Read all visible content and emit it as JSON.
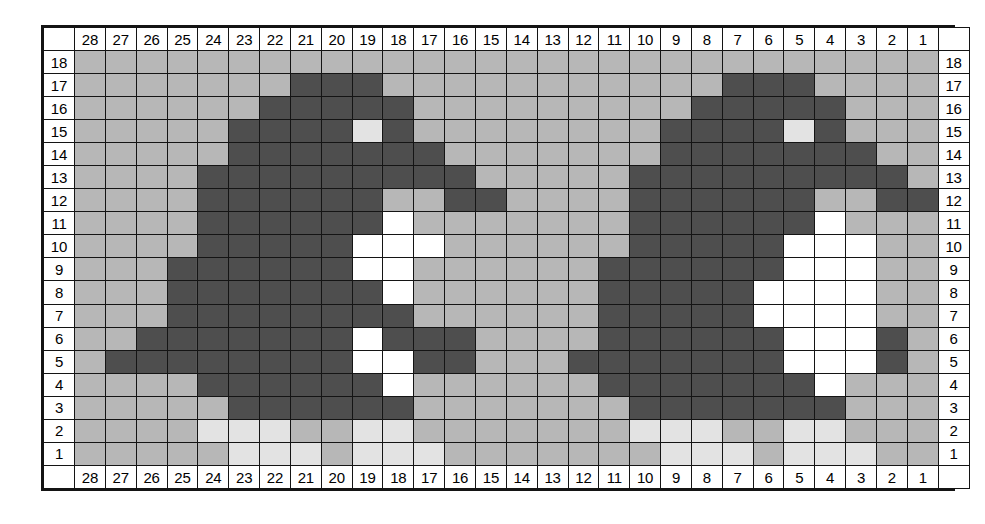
{
  "chart_meta": {
    "title": "",
    "columns": 28,
    "rows": 18,
    "column_order": "right-to-left",
    "row_order": "bottom-to-top"
  },
  "colors": {
    "background_stitch": "#b8b8b8",
    "dark_stitch": "#4a4a4a",
    "light_stitch": "#e6e6e6",
    "white_stitch": "#ffffff",
    "grid_line": "#141414",
    "label_background": "#ffffff",
    "label_text": "#000000"
  },
  "legend_keys": {
    "bg": "background_stitch",
    "d": "dark_stitch",
    "l": "light_stitch",
    "w": "white_stitch"
  },
  "column_labels": [
    "28",
    "27",
    "26",
    "25",
    "24",
    "23",
    "22",
    "21",
    "20",
    "19",
    "18",
    "17",
    "16",
    "15",
    "14",
    "13",
    "12",
    "11",
    "10",
    "9",
    "8",
    "7",
    "6",
    "5",
    "4",
    "3",
    "2",
    "1"
  ],
  "row_labels": [
    "18",
    "17",
    "16",
    "15",
    "14",
    "13",
    "12",
    "11",
    "10",
    "9",
    "8",
    "7",
    "6",
    "5",
    "4",
    "3",
    "2",
    "1"
  ],
  "chart_data": {
    "type": "heatmap",
    "title": "",
    "xlabel": "",
    "ylabel": "",
    "x": [
      "28",
      "27",
      "26",
      "25",
      "24",
      "23",
      "22",
      "21",
      "20",
      "19",
      "18",
      "17",
      "16",
      "15",
      "14",
      "13",
      "12",
      "11",
      "10",
      "9",
      "8",
      "7",
      "6",
      "5",
      "4",
      "3",
      "2",
      "1"
    ],
    "y": [
      "18",
      "17",
      "16",
      "15",
      "14",
      "13",
      "12",
      "11",
      "10",
      "9",
      "8",
      "7",
      "6",
      "5",
      "4",
      "3",
      "2",
      "1"
    ],
    "value_legend": {
      "bg": "medium grey background stitch",
      "d": "dark stitch",
      "l": "light grey stitch",
      "w": "white stitch"
    },
    "grid": [
      {
        "row": "18",
        "cells": [
          "bg",
          "bg",
          "bg",
          "bg",
          "bg",
          "bg",
          "bg",
          "bg",
          "bg",
          "bg",
          "bg",
          "bg",
          "bg",
          "bg",
          "bg",
          "bg",
          "bg",
          "bg",
          "bg",
          "bg",
          "bg",
          "bg",
          "bg",
          "bg",
          "bg",
          "bg",
          "bg",
          "bg"
        ]
      },
      {
        "row": "17",
        "cells": [
          "bg",
          "bg",
          "bg",
          "bg",
          "bg",
          "bg",
          "bg",
          "d",
          "d",
          "d",
          "bg",
          "bg",
          "bg",
          "bg",
          "bg",
          "bg",
          "bg",
          "bg",
          "bg",
          "bg",
          "bg",
          "d",
          "d",
          "d",
          "bg",
          "bg",
          "bg",
          "bg"
        ]
      },
      {
        "row": "16",
        "cells": [
          "bg",
          "bg",
          "bg",
          "bg",
          "bg",
          "bg",
          "d",
          "d",
          "d",
          "d",
          "d",
          "bg",
          "bg",
          "bg",
          "bg",
          "bg",
          "bg",
          "bg",
          "bg",
          "bg",
          "d",
          "d",
          "d",
          "d",
          "d",
          "bg",
          "bg",
          "bg"
        ]
      },
      {
        "row": "15",
        "cells": [
          "bg",
          "bg",
          "bg",
          "bg",
          "bg",
          "d",
          "d",
          "d",
          "d",
          "l",
          "d",
          "bg",
          "bg",
          "bg",
          "bg",
          "bg",
          "bg",
          "bg",
          "bg",
          "d",
          "d",
          "d",
          "d",
          "l",
          "d",
          "bg",
          "bg",
          "bg"
        ]
      },
      {
        "row": "14",
        "cells": [
          "bg",
          "bg",
          "bg",
          "bg",
          "bg",
          "d",
          "d",
          "d",
          "d",
          "d",
          "d",
          "d",
          "bg",
          "bg",
          "bg",
          "bg",
          "bg",
          "bg",
          "bg",
          "d",
          "d",
          "d",
          "d",
          "d",
          "d",
          "d",
          "bg",
          "bg"
        ]
      },
      {
        "row": "13",
        "cells": [
          "bg",
          "bg",
          "bg",
          "bg",
          "d",
          "d",
          "d",
          "d",
          "d",
          "d",
          "d",
          "d",
          "d",
          "bg",
          "bg",
          "bg",
          "bg",
          "bg",
          "d",
          "d",
          "d",
          "d",
          "d",
          "d",
          "d",
          "d",
          "d",
          "bg"
        ]
      },
      {
        "row": "12",
        "cells": [
          "bg",
          "bg",
          "bg",
          "bg",
          "d",
          "d",
          "d",
          "d",
          "d",
          "d",
          "bg",
          "bg",
          "d",
          "d",
          "bg",
          "bg",
          "bg",
          "bg",
          "d",
          "d",
          "d",
          "d",
          "d",
          "d",
          "bg",
          "bg",
          "d",
          "d"
        ]
      },
      {
        "row": "11",
        "cells": [
          "bg",
          "bg",
          "bg",
          "bg",
          "d",
          "d",
          "d",
          "d",
          "d",
          "d",
          "w",
          "bg",
          "bg",
          "bg",
          "bg",
          "bg",
          "bg",
          "bg",
          "d",
          "d",
          "d",
          "d",
          "d",
          "d",
          "w",
          "bg",
          "bg",
          "bg"
        ]
      },
      {
        "row": "10",
        "cells": [
          "bg",
          "bg",
          "bg",
          "bg",
          "d",
          "d",
          "d",
          "d",
          "d",
          "w",
          "w",
          "w",
          "bg",
          "bg",
          "bg",
          "bg",
          "bg",
          "bg",
          "d",
          "d",
          "d",
          "d",
          "d",
          "w",
          "w",
          "w",
          "bg",
          "bg"
        ]
      },
      {
        "row": "9",
        "cells": [
          "bg",
          "bg",
          "bg",
          "d",
          "d",
          "d",
          "d",
          "d",
          "d",
          "w",
          "w",
          "bg",
          "bg",
          "bg",
          "bg",
          "bg",
          "bg",
          "d",
          "d",
          "d",
          "d",
          "d",
          "d",
          "w",
          "w",
          "w",
          "bg",
          "bg"
        ]
      },
      {
        "row": "8",
        "cells": [
          "bg",
          "bg",
          "bg",
          "d",
          "d",
          "d",
          "d",
          "d",
          "d",
          "d",
          "w",
          "bg",
          "bg",
          "bg",
          "bg",
          "bg",
          "bg",
          "d",
          "d",
          "d",
          "d",
          "d",
          "w",
          "w",
          "w",
          "w",
          "bg",
          "bg"
        ]
      },
      {
        "row": "7",
        "cells": [
          "bg",
          "bg",
          "bg",
          "d",
          "d",
          "d",
          "d",
          "d",
          "d",
          "d",
          "d",
          "bg",
          "bg",
          "bg",
          "bg",
          "bg",
          "bg",
          "d",
          "d",
          "d",
          "d",
          "d",
          "w",
          "w",
          "w",
          "w",
          "bg",
          "bg"
        ]
      },
      {
        "row": "6",
        "cells": [
          "bg",
          "bg",
          "d",
          "d",
          "d",
          "d",
          "d",
          "d",
          "d",
          "w",
          "d",
          "d",
          "d",
          "bg",
          "bg",
          "bg",
          "bg",
          "d",
          "d",
          "d",
          "d",
          "d",
          "d",
          "w",
          "w",
          "w",
          "d",
          "bg"
        ]
      },
      {
        "row": "5",
        "cells": [
          "bg",
          "d",
          "d",
          "d",
          "d",
          "d",
          "d",
          "d",
          "d",
          "w",
          "w",
          "d",
          "d",
          "bg",
          "bg",
          "bg",
          "d",
          "d",
          "d",
          "d",
          "d",
          "d",
          "d",
          "w",
          "w",
          "w",
          "d",
          "bg"
        ]
      },
      {
        "row": "4",
        "cells": [
          "bg",
          "bg",
          "bg",
          "bg",
          "d",
          "d",
          "d",
          "d",
          "d",
          "d",
          "w",
          "bg",
          "bg",
          "bg",
          "bg",
          "bg",
          "bg",
          "d",
          "d",
          "d",
          "d",
          "d",
          "d",
          "d",
          "w",
          "bg",
          "bg",
          "bg"
        ]
      },
      {
        "row": "3",
        "cells": [
          "bg",
          "bg",
          "bg",
          "bg",
          "bg",
          "d",
          "d",
          "d",
          "d",
          "d",
          "d",
          "bg",
          "bg",
          "bg",
          "bg",
          "bg",
          "bg",
          "bg",
          "d",
          "d",
          "d",
          "d",
          "d",
          "d",
          "d",
          "bg",
          "bg",
          "bg"
        ]
      },
      {
        "row": "2",
        "cells": [
          "bg",
          "bg",
          "bg",
          "bg",
          "l",
          "l",
          "l",
          "bg",
          "bg",
          "l",
          "l",
          "bg",
          "bg",
          "bg",
          "bg",
          "bg",
          "bg",
          "bg",
          "l",
          "l",
          "l",
          "bg",
          "bg",
          "l",
          "l",
          "bg",
          "bg",
          "bg"
        ]
      },
      {
        "row": "1",
        "cells": [
          "bg",
          "bg",
          "bg",
          "bg",
          "bg",
          "l",
          "l",
          "l",
          "bg",
          "l",
          "l",
          "l",
          "bg",
          "bg",
          "bg",
          "bg",
          "bg",
          "bg",
          "bg",
          "l",
          "l",
          "l",
          "bg",
          "l",
          "l",
          "l",
          "bg",
          "bg"
        ]
      }
    ]
  }
}
